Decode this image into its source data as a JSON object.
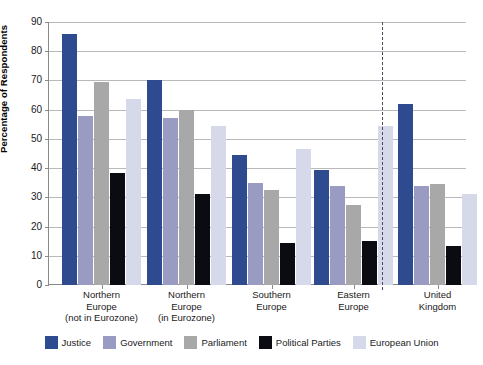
{
  "chart_data": {
    "type": "bar",
    "title": "",
    "subtitle": "",
    "xlabel": "",
    "ylabel": "Percentage of Respondents",
    "ylim": [
      0,
      90
    ],
    "ytick_step": 10,
    "yticks": [
      0,
      10,
      20,
      30,
      40,
      50,
      60,
      70,
      80,
      90
    ],
    "ytick_labels": [
      "0",
      "10",
      "20",
      "30",
      "40",
      "50",
      "60",
      "70",
      "80",
      "90"
    ],
    "grid": "horizontal",
    "legend_position": "bottom",
    "categories": [
      "Northern Europe (not in Eurozone)",
      "Northern Europe (in Eurozone)",
      "Southern Europe",
      "Eastern Europe",
      "United Kingdom"
    ],
    "category_lines": [
      [
        "Northern",
        "Europe",
        "(not in Eurozone)"
      ],
      [
        "Northern",
        "Europe",
        "(in Eurozone)"
      ],
      [
        "Southern",
        "Europe"
      ],
      [
        "Eastern",
        "Europe"
      ],
      [
        "United",
        "Kingdom"
      ]
    ],
    "series": [
      {
        "name": "Justice",
        "color": "#2e4b8f",
        "values": [
          86,
          70,
          44.5,
          39.5,
          62
        ]
      },
      {
        "name": "Government",
        "color": "#9a9bc2",
        "values": [
          58,
          57,
          35,
          34,
          34
        ]
      },
      {
        "name": "Parliament",
        "color": "#a8a8a8",
        "values": [
          69.5,
          60,
          32.5,
          27.5,
          34.5
        ]
      },
      {
        "name": "Political Parties",
        "color": "#0b0b12",
        "values": [
          38.5,
          31,
          14.5,
          15,
          13.5
        ]
      },
      {
        "name": "European Union",
        "color": "#d5d9ea",
        "values": [
          63.5,
          54.5,
          46.5,
          54.5,
          31
        ]
      }
    ],
    "annotations": [
      {
        "type": "vertical-dashed-divider",
        "after_category": "Eastern Europe",
        "color": "#4a4a58"
      }
    ]
  }
}
